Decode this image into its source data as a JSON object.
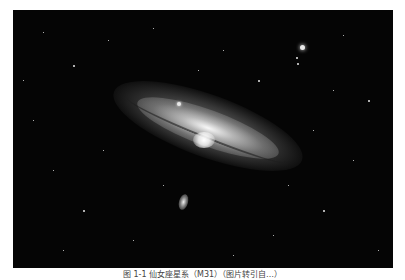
{
  "figure": {
    "caption": "图 1-1  仙女座星系（M31）（图片转引自…）",
    "colors": {
      "background": "#050505",
      "page": "#ffffff",
      "caption_text": "#444444"
    }
  }
}
